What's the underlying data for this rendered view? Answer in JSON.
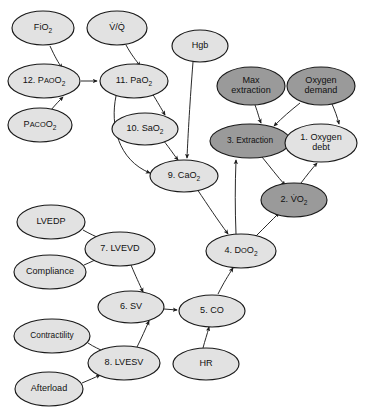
{
  "diagram": {
    "type": "flowchart",
    "title": "",
    "background_color": "#ffffff",
    "node_shape": "ellipse",
    "colors": {
      "light_fill": "#e2e2e2",
      "dark_fill": "#9a9a9a",
      "stroke": "#1a1a1a",
      "edge": "#1d1d1d",
      "text": "#111111"
    },
    "legend_note": "",
    "nodes": [
      {
        "id": "fio2",
        "label": "FiO2",
        "text_parts": [
          "F",
          "IO",
          "2"
        ],
        "display": "FiO₂",
        "style": "light",
        "cx": 43,
        "cy": 28,
        "rx": 31,
        "ry": 17
      },
      {
        "id": "vq",
        "label": "V/Q",
        "display": "V̇/Q̇",
        "style": "light",
        "cx": 117,
        "cy": 28,
        "rx": 30,
        "ry": 17
      },
      {
        "id": "hgb",
        "label": "Hgb",
        "display": "Hgb",
        "style": "light",
        "cx": 200,
        "cy": 46,
        "rx": 28,
        "ry": 16
      },
      {
        "id": "n12_pao2",
        "label": "12. PAO2",
        "display": "12. PᴀᴏO₂",
        "style": "light",
        "cx": 44,
        "cy": 81,
        "rx": 36,
        "ry": 17
      },
      {
        "id": "n11_pao2",
        "label": "11. PaO2",
        "display": "11. PaO₂",
        "style": "light",
        "cx": 134,
        "cy": 81,
        "rx": 34,
        "ry": 17
      },
      {
        "id": "max_extract",
        "label": "Max extraction",
        "display": "Max extraction",
        "lines": [
          "Max",
          "extraction"
        ],
        "style": "dark",
        "cx": 251,
        "cy": 86,
        "rx": 34,
        "ry": 19
      },
      {
        "id": "o2_demand",
        "label": "Oxygen demand",
        "display": "Oxygen demand",
        "lines": [
          "Oxygen",
          "demand"
        ],
        "style": "dark",
        "cx": 321,
        "cy": 86,
        "rx": 34,
        "ry": 19
      },
      {
        "id": "paco2",
        "label": "PACO2",
        "display": "PᴀᴄᴏO₂",
        "style": "light",
        "cx": 40,
        "cy": 125,
        "rx": 32,
        "ry": 17
      },
      {
        "id": "n10_sao2",
        "label": "10. SaO2",
        "display": "10. SaO₂",
        "style": "light",
        "cx": 145,
        "cy": 129,
        "rx": 33,
        "ry": 16
      },
      {
        "id": "n3_extract",
        "label": "3. Extraction",
        "display": "3. Extraction",
        "style": "dark",
        "cx": 250,
        "cy": 141,
        "rx": 40,
        "ry": 17
      },
      {
        "id": "n1_o2_debt",
        "label": "1. Oxygen debt",
        "display": "1. Oxygen debt",
        "lines": [
          "1. Oxygen",
          "debt"
        ],
        "style": "light",
        "cx": 321,
        "cy": 143,
        "rx": 36,
        "ry": 19
      },
      {
        "id": "n9_cao2",
        "label": "9. CaO2",
        "display": "9. CaO₂",
        "style": "light",
        "cx": 184,
        "cy": 176,
        "rx": 34,
        "ry": 16
      },
      {
        "id": "n2_vo2",
        "label": "2. VO2",
        "display": "2. V̇O₂",
        "style": "dark",
        "cx": 294,
        "cy": 200,
        "rx": 33,
        "ry": 17
      },
      {
        "id": "lvedp",
        "label": "LVEDP",
        "display": "LVEDP",
        "style": "light",
        "cx": 51,
        "cy": 222,
        "rx": 34,
        "ry": 17
      },
      {
        "id": "n4_do2",
        "label": "4. DO2",
        "display": "4. DᴏO₂",
        "style": "light",
        "cx": 241,
        "cy": 251,
        "rx": 35,
        "ry": 17
      },
      {
        "id": "n7_lvevd",
        "label": "7. LVEVD",
        "display": "7. LVEVD",
        "style": "light",
        "cx": 120,
        "cy": 249,
        "rx": 35,
        "ry": 17
      },
      {
        "id": "compliance",
        "label": "Compliance",
        "display": "Compliance",
        "style": "light",
        "cx": 50,
        "cy": 272,
        "rx": 36,
        "ry": 17
      },
      {
        "id": "n6_sv",
        "label": "6. SV",
        "display": "6. SV",
        "style": "light",
        "cx": 131,
        "cy": 307,
        "rx": 33,
        "ry": 16
      },
      {
        "id": "n5_co",
        "label": "5. CO",
        "display": "5. CO",
        "style": "light",
        "cx": 212,
        "cy": 311,
        "rx": 33,
        "ry": 16
      },
      {
        "id": "contractility",
        "label": "Contractility",
        "display": "Contractility",
        "style": "light",
        "cx": 52,
        "cy": 336,
        "rx": 38,
        "ry": 17
      },
      {
        "id": "n8_lvesv",
        "label": "8. LVESV",
        "display": "8. LVESV",
        "style": "light",
        "cx": 124,
        "cy": 363,
        "rx": 36,
        "ry": 17
      },
      {
        "id": "hr",
        "label": "HR",
        "display": "HR",
        "style": "light",
        "cx": 206,
        "cy": 364,
        "rx": 33,
        "ry": 16
      },
      {
        "id": "afterload",
        "label": "Afterload",
        "display": "Afterload",
        "style": "light",
        "cx": 49,
        "cy": 389,
        "rx": 34,
        "ry": 17
      }
    ],
    "edges": [
      {
        "from": "fio2",
        "to": "n12_pao2",
        "path": "M 50 46 C 55 57 58 62 62 68"
      },
      {
        "from": "vq",
        "to": "n11_pao2",
        "path": "M 126 45 C 132 56 136 60 140 66"
      },
      {
        "from": "n12_pao2",
        "to": "n11_pao2",
        "path": "M 81 81 L 97 81"
      },
      {
        "from": "paco2",
        "to": "n12_pao2",
        "path": "M 51 110 C 56 104 59 101 63 97"
      },
      {
        "from": "hgb",
        "to": "n9_cao2",
        "path": "M 193 62 C 190 100 188 135 187 158"
      },
      {
        "from": "n11_pao2",
        "to": "n10_sao2",
        "path": "M 152 93 C 158 103 161 108 165 115"
      },
      {
        "from": "n11_pao2",
        "to": "n9_cao2",
        "path": "M 116 96 C 110 125 118 160 150 173"
      },
      {
        "from": "n10_sao2",
        "to": "n9_cao2",
        "path": "M 163 140 C 171 150 174 155 178 160"
      },
      {
        "from": "max_extract",
        "to": "n3_extract",
        "path": "M 255 105 C 258 113 259 118 261 123"
      },
      {
        "from": "o2_demand",
        "to": "n3_extract",
        "path": "M 300 103 C 290 111 283 117 274 126"
      },
      {
        "from": "o2_demand",
        "to": "n1_o2_debt",
        "path": "M 332 104 C 335 111 337 116 339 124"
      },
      {
        "from": "n4_do2",
        "to": "n3_extract",
        "path": "M 236 234 C 235 210 235 185 236 160"
      },
      {
        "from": "n3_extract",
        "to": "n2_vo2",
        "path": "M 262 157 C 271 168 277 176 285 185"
      },
      {
        "from": "n4_do2",
        "to": "n2_vo2",
        "path": "M 256 236 C 265 227 271 221 279 213"
      },
      {
        "from": "n2_vo2",
        "to": "n1_o2_debt",
        "path": "M 301 183 C 307 175 311 170 317 163"
      },
      {
        "from": "n9_cao2",
        "to": "n4_do2",
        "path": "M 197 189 C 209 207 217 219 228 234"
      },
      {
        "from": "lvedp",
        "to": "n7_lvevd",
        "path": "M 83 230 C 90 234 95 236 101 239"
      },
      {
        "from": "compliance",
        "to": "n7_lvevd",
        "path": "M 84 265 C 91 262 95 260 101 257"
      },
      {
        "from": "n7_lvevd",
        "to": "n6_sv",
        "path": "M 131 265 C 136 277 139 283 143 292"
      },
      {
        "from": "n8_lvesv",
        "to": "n6_sv",
        "path": "M 137 347 C 142 337 145 330 149 321"
      },
      {
        "from": "contractility",
        "to": "n8_lvesv",
        "path": "M 88 343 C 94 347 99 349 105 352"
      },
      {
        "from": "afterload",
        "to": "n8_lvesv",
        "path": "M 82 383 C 89 380 94 378 100 375"
      },
      {
        "from": "n6_sv",
        "to": "n5_co",
        "path": "M 164 309 L 177 310"
      },
      {
        "from": "n5_co",
        "to": "n4_do2",
        "path": "M 218 294 C 224 282 228 276 233 268"
      },
      {
        "from": "hr",
        "to": "n5_co",
        "path": "M 203 348 C 205 340 207 335 209 327"
      }
    ]
  }
}
